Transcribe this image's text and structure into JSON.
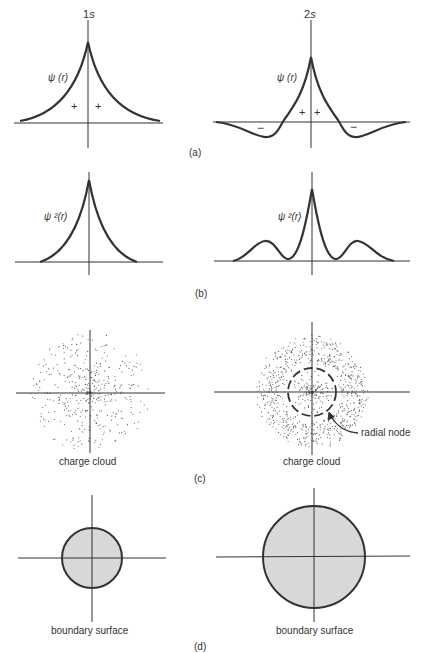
{
  "columns": {
    "left": {
      "title_num": "1",
      "title_orb": "s"
    },
    "right": {
      "title_num": "2",
      "title_orb": "s"
    }
  },
  "panels": {
    "a": {
      "label": "(a)",
      "left_curve_label": "ψ (r)",
      "right_curve_label": "ψ (r)",
      "plus": "+",
      "minus": "−"
    },
    "b": {
      "label": "(b)",
      "left_curve_label": "ψ ²(r)",
      "right_curve_label": "ψ ²(r)"
    },
    "c": {
      "label": "(c)",
      "left_caption": "charge cloud",
      "right_caption": "charge cloud",
      "node_label": "radial node"
    },
    "d": {
      "label": "(d)",
      "left_caption": "boundary surface",
      "right_caption": "boundary surface"
    }
  },
  "colors": {
    "line": "#333333",
    "fill": "#d8d8d8",
    "dot": "#555555"
  },
  "chart_data": [
    {
      "type": "line",
      "title": "1s ψ(r)",
      "xlabel": "r",
      "ylabel": "ψ(r)",
      "shape": "cusp peak at r=0, exponential decay, all positive",
      "signs": [
        "+",
        "+"
      ]
    },
    {
      "type": "line",
      "title": "2s ψ(r)",
      "xlabel": "r",
      "ylabel": "ψ(r)",
      "shape": "cusp peak at r=0, crosses zero at radial node, negative lobes",
      "signs": [
        "−",
        "+",
        "+",
        "−"
      ]
    },
    {
      "type": "line",
      "title": "1s ψ²(r)",
      "ylabel": "ψ²(r)",
      "shape": "single cusp peak"
    },
    {
      "type": "line",
      "title": "2s ψ²(r)",
      "ylabel": "ψ²(r)",
      "shape": "central peak, zeros at radial node, two secondary maxima"
    }
  ]
}
